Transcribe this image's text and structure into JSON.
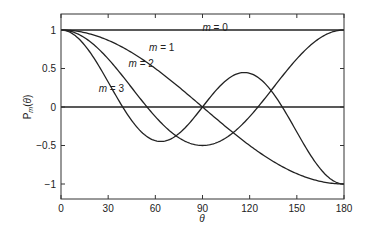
{
  "chart_data": {
    "type": "line",
    "title": "",
    "xlabel": "θ",
    "ylabel": "P_m(θ)",
    "xlim": [
      0,
      180
    ],
    "ylim": [
      -1.2,
      1.2
    ],
    "x_ticks": [
      0,
      30,
      60,
      90,
      120,
      150,
      180
    ],
    "y_ticks": [
      -1,
      -0.5,
      0,
      0.5,
      1
    ],
    "y_tick_labels": [
      "−1",
      "−0.5",
      "0",
      "0.5",
      "1"
    ],
    "grid": false,
    "legend": "inline labels",
    "series": [
      {
        "name": "m = 0",
        "x": [
          0,
          30,
          60,
          90,
          120,
          150,
          180
        ],
        "values": [
          1,
          1,
          1,
          1,
          1,
          1,
          1
        ]
      },
      {
        "name": "m = 1",
        "x": [
          0,
          30,
          60,
          90,
          120,
          150,
          180
        ],
        "values": [
          1,
          0.87,
          0.5,
          0,
          -0.5,
          -0.87,
          -1
        ]
      },
      {
        "name": "m = 2",
        "x": [
          0,
          30,
          60,
          90,
          120,
          150,
          180
        ],
        "values": [
          1,
          0.63,
          -0.13,
          -0.5,
          -0.13,
          0.63,
          1
        ]
      },
      {
        "name": "m = 3",
        "x": [
          0,
          30,
          60,
          90,
          120,
          150,
          180
        ],
        "values": [
          1,
          0.32,
          -0.44,
          0,
          0.44,
          -0.32,
          -1
        ]
      }
    ],
    "reference_lines": [
      {
        "y": 0
      }
    ],
    "annotations": [
      {
        "text": "m = 0",
        "x": 90,
        "y": 1.04
      },
      {
        "text": "m = 1",
        "x": 56,
        "y": 0.78
      },
      {
        "text": "m = 2",
        "x": 43,
        "y": 0.57
      },
      {
        "text": "m = 3",
        "x": 24,
        "y": 0.25
      }
    ]
  }
}
